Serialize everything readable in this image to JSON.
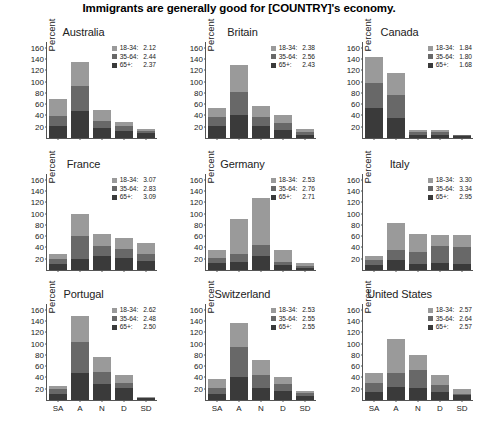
{
  "chart_data": {
    "type": "bar",
    "title": "Immigrants are generally good for [COUNTRY]'s economy.",
    "subtype": "stacked-bar small multiples",
    "xlabel": "",
    "ylabel": "Percent",
    "ylim": [
      0,
      170
    ],
    "yticks": [
      20,
      40,
      60,
      80,
      100,
      120,
      140,
      160
    ],
    "categories": [
      "SA",
      "A",
      "N",
      "D",
      "SD"
    ],
    "category_labels_shown_on": "bottom row only",
    "grid": false,
    "legend_position": "top-right inside panel",
    "series_names": [
      "18-34",
      "35-64",
      "65+"
    ],
    "series_colors": [
      "#9a9a9a",
      "#686868",
      "#3a3a3a"
    ],
    "panels": [
      {
        "name": "Australia",
        "legend": [
          {
            "key": "18-34:",
            "value": "2.12"
          },
          {
            "key": "35-64:",
            "value": "2.44"
          },
          {
            "key": "65+:",
            "value": "2.37"
          }
        ],
        "series": [
          {
            "name": "65+",
            "values": [
              22,
              47,
              18,
              12,
              8
            ]
          },
          {
            "name": "35-64",
            "values": [
              17,
              45,
              12,
              9,
              5
            ]
          },
          {
            "name": "18-34",
            "values": [
              30,
              43,
              19,
              8,
              3
            ]
          }
        ],
        "totals": [
          69,
          135,
          49,
          29,
          16
        ]
      },
      {
        "name": "Britain",
        "legend": [
          {
            "key": "18-34:",
            "value": "2.38"
          },
          {
            "key": "35-64:",
            "value": "2.56"
          },
          {
            "key": "65+:",
            "value": "2.43"
          }
        ],
        "series": [
          {
            "name": "65+",
            "values": [
              21,
              41,
              22,
              15,
              6
            ]
          },
          {
            "name": "35-64",
            "values": [
              16,
              40,
              15,
              11,
              5
            ]
          },
          {
            "name": "18-34",
            "values": [
              17,
              49,
              20,
              15,
              5
            ]
          }
        ],
        "totals": [
          54,
          130,
          57,
          41,
          16
        ]
      },
      {
        "name": "Canada",
        "legend": [
          {
            "key": "18-34:",
            "value": "1.84"
          },
          {
            "key": "35-64:",
            "value": "1.80"
          },
          {
            "key": "65+:",
            "value": "1.68"
          }
        ],
        "series": [
          {
            "name": "65+",
            "values": [
              53,
              36,
              5,
              5,
              3
            ]
          },
          {
            "name": "35-64",
            "values": [
              45,
              40,
              5,
              5,
              2
            ]
          },
          {
            "name": "18-34",
            "values": [
              46,
              39,
              4,
              4,
              1
            ]
          }
        ],
        "totals": [
          144,
          115,
          14,
          14,
          6
        ]
      },
      {
        "name": "France",
        "legend": [
          {
            "key": "18-34:",
            "value": "3.07"
          },
          {
            "key": "35-64:",
            "value": "2.83"
          },
          {
            "key": "65+:",
            "value": "3.09"
          }
        ],
        "series": [
          {
            "name": "65+",
            "values": [
              11,
              19,
              24,
              21,
              16
            ]
          },
          {
            "name": "35-64",
            "values": [
              9,
              42,
              19,
              17,
              13
            ]
          },
          {
            "name": "18-34",
            "values": [
              8,
              38,
              21,
              19,
              18
            ]
          }
        ],
        "totals": [
          28,
          99,
          64,
          57,
          47
        ]
      },
      {
        "name": "Germany",
        "legend": [
          {
            "key": "18-34:",
            "value": "2.53"
          },
          {
            "key": "35-64:",
            "value": "2.76"
          },
          {
            "key": "65+:",
            "value": "2.71"
          }
        ],
        "series": [
          {
            "name": "65+",
            "values": [
              12,
              15,
              24,
              8,
              4
            ]
          },
          {
            "name": "35-64",
            "values": [
              10,
              13,
              21,
              6,
              4
            ]
          },
          {
            "name": "18-34",
            "values": [
              13,
              63,
              82,
              21,
              5
            ]
          }
        ],
        "totals": [
          35,
          91,
          127,
          35,
          13
        ]
      },
      {
        "name": "Italy",
        "legend": [
          {
            "key": "18-34:",
            "value": "3.30"
          },
          {
            "key": "35-64:",
            "value": "3.34"
          },
          {
            "key": "65+:",
            "value": "2.95"
          }
        ],
        "series": [
          {
            "name": "65+",
            "values": [
              9,
              18,
              10,
              12,
              10
            ]
          },
          {
            "name": "35-64",
            "values": [
              8,
              18,
              22,
              31,
              30
            ]
          },
          {
            "name": "18-34",
            "values": [
              8,
              47,
              31,
              19,
              22
            ]
          }
        ],
        "totals": [
          25,
          83,
          63,
          62,
          62
        ]
      },
      {
        "name": "Portugal",
        "legend": [
          {
            "key": "18-34:",
            "value": "2.62"
          },
          {
            "key": "35-64:",
            "value": "2.48"
          },
          {
            "key": "65+:",
            "value": "2.50"
          }
        ],
        "series": [
          {
            "name": "65+",
            "values": [
              11,
              48,
              28,
              22,
              3
            ]
          },
          {
            "name": "35-64",
            "values": [
              8,
              54,
              22,
              8,
              1
            ]
          },
          {
            "name": "18-34",
            "values": [
              6,
              47,
              26,
              14,
              1
            ]
          }
        ],
        "totals": [
          25,
          149,
          76,
          44,
          5
        ]
      },
      {
        "name": "Switzerland",
        "legend": [
          {
            "key": "18-34:",
            "value": "2.53"
          },
          {
            "key": "35-64:",
            "value": "2.55"
          },
          {
            "key": "65+:",
            "value": "2.55"
          }
        ],
        "series": [
          {
            "name": "65+",
            "values": [
              10,
              41,
              21,
              16,
              7
            ]
          },
          {
            "name": "35-64",
            "values": [
              12,
              53,
              24,
              13,
              5
            ]
          },
          {
            "name": "18-34",
            "values": [
              16,
              42,
              26,
              12,
              4
            ]
          }
        ],
        "totals": [
          38,
          136,
          71,
          41,
          16
        ]
      },
      {
        "name": "United States",
        "legend": [
          {
            "key": "18-34:",
            "value": "2.57"
          },
          {
            "key": "35-64:",
            "value": "2.64"
          },
          {
            "key": "65+:",
            "value": "2.57"
          }
        ],
        "series": [
          {
            "name": "65+",
            "values": [
              15,
              23,
              21,
              15,
              8
            ]
          },
          {
            "name": "35-64",
            "values": [
              16,
              24,
              32,
              12,
              3
            ]
          },
          {
            "name": "18-34",
            "values": [
              17,
              61,
              27,
              17,
              8
            ]
          }
        ],
        "totals": [
          48,
          108,
          80,
          44,
          19
        ]
      }
    ]
  }
}
